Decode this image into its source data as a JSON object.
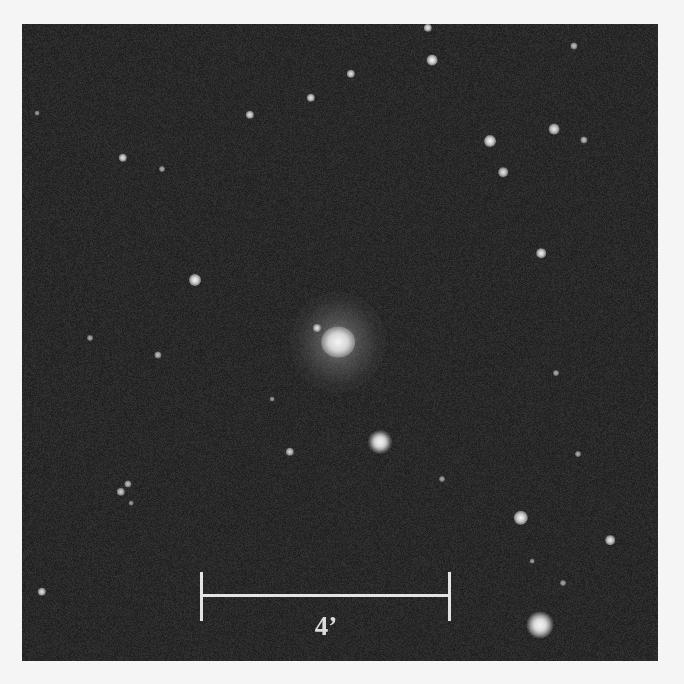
{
  "image": {
    "description": "Astronomical sky field: bright central elliptical galaxy surrounded by foreground stars, with angular scale bar",
    "colors": {
      "border": "#f5f5f5",
      "sky_background": "#262626",
      "scale_bar": "#e4e4e4"
    },
    "frame": {
      "left": 22,
      "top": 24,
      "width": 636,
      "height": 637
    }
  },
  "galaxy": {
    "x": 338,
    "y": 342,
    "core_radius": 14,
    "halo_radius": 48,
    "companion": {
      "x": 317,
      "y": 328,
      "r": 4
    }
  },
  "stars": [
    {
      "x": 428,
      "y": 28,
      "r": 3.5,
      "b": 0.9
    },
    {
      "x": 432,
      "y": 60,
      "r": 4.5,
      "b": 1.0
    },
    {
      "x": 574,
      "y": 46,
      "r": 3,
      "b": 0.6
    },
    {
      "x": 351,
      "y": 74,
      "r": 3.5,
      "b": 0.85
    },
    {
      "x": 311,
      "y": 98,
      "r": 3.5,
      "b": 0.85
    },
    {
      "x": 250,
      "y": 115,
      "r": 3.5,
      "b": 0.85
    },
    {
      "x": 37,
      "y": 113,
      "r": 2,
      "b": 0.35
    },
    {
      "x": 123,
      "y": 158,
      "r": 3.5,
      "b": 0.85
    },
    {
      "x": 162,
      "y": 169,
      "r": 2.5,
      "b": 0.45
    },
    {
      "x": 490,
      "y": 141,
      "r": 5,
      "b": 1.0
    },
    {
      "x": 554,
      "y": 129,
      "r": 4.5,
      "b": 0.9
    },
    {
      "x": 584,
      "y": 140,
      "r": 3,
      "b": 0.6
    },
    {
      "x": 503,
      "y": 172,
      "r": 4,
      "b": 0.85
    },
    {
      "x": 541,
      "y": 253,
      "r": 4,
      "b": 0.95
    },
    {
      "x": 195,
      "y": 280,
      "r": 5,
      "b": 1.0
    },
    {
      "x": 90,
      "y": 338,
      "r": 2.5,
      "b": 0.45
    },
    {
      "x": 158,
      "y": 355,
      "r": 3,
      "b": 0.6
    },
    {
      "x": 272,
      "y": 399,
      "r": 2,
      "b": 0.35
    },
    {
      "x": 556,
      "y": 373,
      "r": 2.5,
      "b": 0.45
    },
    {
      "x": 290,
      "y": 452,
      "r": 3.5,
      "b": 0.75
    },
    {
      "x": 442,
      "y": 479,
      "r": 2.5,
      "b": 0.4
    },
    {
      "x": 578,
      "y": 454,
      "r": 2.5,
      "b": 0.45
    },
    {
      "x": 128,
      "y": 484,
      "r": 3,
      "b": 0.6
    },
    {
      "x": 121,
      "y": 492,
      "r": 3.5,
      "b": 0.7
    },
    {
      "x": 131,
      "y": 503,
      "r": 2,
      "b": 0.35
    },
    {
      "x": 521,
      "y": 518,
      "r": 6,
      "b": 1.0
    },
    {
      "x": 610,
      "y": 540,
      "r": 4,
      "b": 0.9
    },
    {
      "x": 42,
      "y": 592,
      "r": 3.5,
      "b": 0.85
    },
    {
      "x": 563,
      "y": 583,
      "r": 2.5,
      "b": 0.4
    },
    {
      "x": 532,
      "y": 561,
      "r": 2,
      "b": 0.35
    }
  ],
  "bright_stars": [
    {
      "x": 380,
      "y": 442,
      "r": 8,
      "spike": 14
    },
    {
      "x": 540,
      "y": 625,
      "r": 9,
      "spike": 20
    }
  ],
  "scale_bar": {
    "label": "4’",
    "left_x": 201,
    "right_x": 449,
    "bar_y": 595,
    "tick_top": 572,
    "tick_bottom": 621,
    "label_x": 326,
    "label_y": 611
  }
}
